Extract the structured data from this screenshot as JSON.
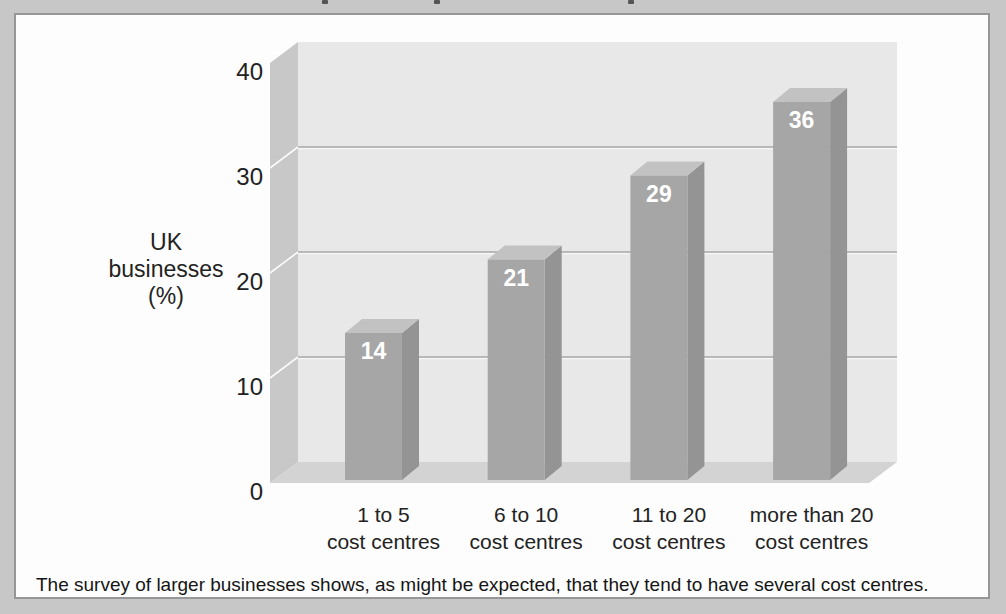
{
  "figure": {
    "caption": "The survey of larger businesses shows, as might be expected, that they tend to have several cost centres."
  },
  "chart_data": {
    "type": "bar",
    "style": "3d-column",
    "title": "",
    "categories": [
      [
        "1 to 5",
        "cost centres"
      ],
      [
        "6 to 10",
        "cost centres"
      ],
      [
        "11 to 20",
        "cost centres"
      ],
      [
        "more than 20",
        "cost centres"
      ]
    ],
    "values": [
      14,
      21,
      29,
      36
    ],
    "bar_value_labels": [
      "14",
      "21",
      "29",
      "36"
    ],
    "ylabel_lines": [
      "UK",
      "businesses",
      "(%)"
    ],
    "xlabel": "",
    "yticks": [
      0,
      10,
      20,
      30,
      40
    ],
    "ylim": [
      0,
      40
    ],
    "grid": true,
    "legend": "none",
    "colors": {
      "bar_front": "#a6a6a6",
      "bar_side": "#949494",
      "bar_top": "#c2c2c2",
      "back_wall": "#e8e8e8",
      "left_wall": "#c8c8c8",
      "floor": "#d3d3d3",
      "gridline": "#a8a8a8",
      "gridline_highlight": "#f7f7f7",
      "value_label": "#ffffff",
      "text": "#222222"
    }
  }
}
